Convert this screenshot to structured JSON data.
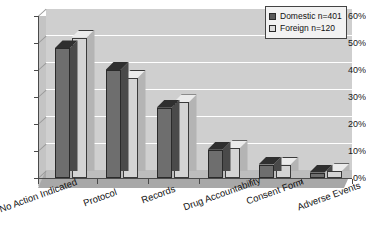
{
  "chart_data": {
    "type": "bar",
    "title": "",
    "xlabel": "",
    "ylabel": "",
    "ylim": [
      0,
      60
    ],
    "ytick_labels": [
      "0%",
      "10%",
      "20%",
      "30%",
      "40%",
      "50%",
      "60%"
    ],
    "ytick_values": [
      0,
      10,
      20,
      30,
      40,
      50,
      60
    ],
    "grid": true,
    "legend_position": "top-right",
    "categories": [
      "No Action Indicated",
      "Protocol",
      "Records",
      "Drug Accountability",
      "Consent Form",
      "Adverse Events"
    ],
    "series": [
      {
        "name": "Domestic n=401",
        "values": [
          48,
          40,
          26,
          10.5,
          5,
          2
        ]
      },
      {
        "name": "Foreign n=120",
        "values": [
          52,
          37,
          28,
          11,
          5,
          2.5
        ]
      }
    ]
  },
  "legend": {
    "items": [
      {
        "label": "Domestic n=401",
        "color": "#5a5a5a"
      },
      {
        "label": "Foreign n=120",
        "color": "#dcdcdc"
      }
    ]
  },
  "colors": {
    "domestic": "#6e6e6e",
    "foreign": "#d4d4d4",
    "plot_background": "#cfcfcf",
    "floor": "#a8a8a8",
    "gridline": "#ffffff",
    "axis": "#4a4a4a"
  }
}
